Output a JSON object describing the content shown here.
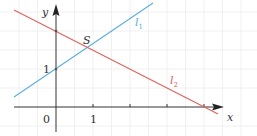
{
  "diagram": {
    "type": "coordinate-plane",
    "axes": {
      "x_label": "x",
      "y_label": "y",
      "origin_label": "0",
      "x_tick_label": "1",
      "y_tick_label": "1"
    },
    "lines": [
      {
        "name": "l1",
        "label": "l",
        "subscript": "1",
        "color": "#5aafd9",
        "equation": "y = 1 + x/... (passes through (0,1) and S)"
      },
      {
        "name": "l2",
        "label": "l",
        "subscript": "2",
        "color": "#e0605a",
        "equation": "y = 2 - x/2 (passes through (0,2) and (4,0))"
      }
    ],
    "intersection": {
      "label": "S"
    },
    "colors": {
      "axis": "#333333",
      "grid": "#e6e6e6",
      "l1": "#5aafd9",
      "l2": "#e0605a"
    }
  }
}
